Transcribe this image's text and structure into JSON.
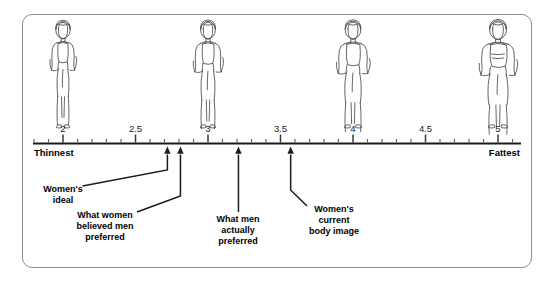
{
  "figure": {
    "panel_name": "body-image-scale-figure",
    "border_color": "#8e8e90",
    "axis_color": "#1a1a1a"
  },
  "chart_data": {
    "type": "scatter",
    "title": "",
    "xlabel": "",
    "ylabel": "",
    "xlim": [
      1.72,
      5.28
    ],
    "grid": false,
    "legend": null,
    "axis_end_labels": {
      "left": "Thinnest",
      "right": "Fattest"
    },
    "tick_labels": [
      "2",
      "2.5",
      "3",
      "3.5",
      "4",
      "4.5",
      "5"
    ],
    "tick_values": [
      2,
      2.5,
      3,
      3.5,
      4,
      4.5,
      5
    ],
    "minor_tick_step": 0.1,
    "categories": [
      "Women's ideal",
      "What women believed men preferred",
      "What men actually preferred",
      "Women's current body image"
    ],
    "values": [
      2.72,
      2.81,
      3.21,
      3.57
    ],
    "annotations": [
      {
        "label": "Women's\nideal",
        "lines": [
          "Women's",
          "ideal"
        ],
        "value": 2.72,
        "label_x": 63,
        "label_y": 192
      },
      {
        "label": "What women\nbelieved men\npreferred",
        "lines": [
          "What women",
          "believed men",
          "preferred"
        ],
        "value": 2.81,
        "label_x": 105,
        "label_y": 218
      },
      {
        "label": "What men\nactually\npreferred",
        "lines": [
          "What men",
          "actually",
          "preferred"
        ],
        "value": 3.21,
        "label_x": 238,
        "label_y": 222
      },
      {
        "label": "Women's\ncurrent\nbody image",
        "lines": [
          "Women's",
          "current",
          "body image"
        ],
        "value": 3.57,
        "label_x": 334,
        "label_y": 212
      }
    ],
    "body_figures": [
      {
        "name": "figure-at-2",
        "value": 2,
        "x": 63,
        "size": "thinnest"
      },
      {
        "name": "figure-at-3",
        "value": 3,
        "x": 208,
        "size": "thin"
      },
      {
        "name": "figure-at-4",
        "value": 4,
        "x": 353,
        "size": "medium"
      },
      {
        "name": "figure-at-5",
        "value": 5,
        "x": 498,
        "size": "fattest"
      }
    ]
  }
}
